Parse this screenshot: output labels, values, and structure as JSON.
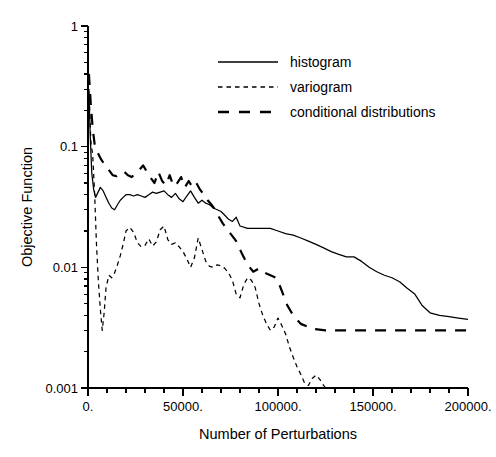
{
  "chart_data": {
    "type": "line",
    "title": "",
    "xlabel": "Number of Perturbations",
    "ylabel": "Objective Function",
    "xlim": [
      0,
      200000
    ],
    "ylim": [
      0.001,
      1
    ],
    "yscale": "log",
    "xscale": "linear",
    "grid": false,
    "legend_position": "top-center",
    "x_ticks": [
      0,
      50000,
      100000,
      150000,
      200000
    ],
    "x_tick_labels": [
      "0.",
      "50000.",
      "100000.",
      "150000.",
      "200000."
    ],
    "x_minor_tick_count_between": 4,
    "y_ticks": [
      1,
      0.1,
      0.01,
      0.001
    ],
    "y_tick_labels": [
      "1",
      "0.1",
      "0.01",
      "0.001"
    ],
    "series": [
      {
        "name": "histogram",
        "style": "solid",
        "x": [
          500,
          1200,
          2000,
          3000,
          4000,
          5000,
          6500,
          8000,
          9500,
          11000,
          12500,
          14000,
          15500,
          17000,
          18500,
          20000,
          22000,
          24000,
          26000,
          28000,
          30000,
          32000,
          34000,
          36000,
          38000,
          40000,
          42000,
          44000,
          46000,
          48000,
          50000,
          52000,
          54000,
          56000,
          58000,
          60000,
          62000,
          64000,
          66000,
          68000,
          70000,
          72000,
          74000,
          76000,
          78000,
          80000,
          84000,
          88000,
          92000,
          96000,
          100000,
          104000,
          108000,
          112000,
          116000,
          120000,
          124000,
          128000,
          132000,
          136000,
          140000,
          144000,
          148000,
          152000,
          156000,
          160000,
          164000,
          168000,
          172000,
          176000,
          180000,
          185000,
          190000,
          195000,
          200000
        ],
        "y": [
          0.28,
          0.12,
          0.06,
          0.044,
          0.038,
          0.041,
          0.046,
          0.043,
          0.038,
          0.034,
          0.031,
          0.03,
          0.033,
          0.036,
          0.038,
          0.04,
          0.04,
          0.039,
          0.04,
          0.039,
          0.038,
          0.04,
          0.042,
          0.041,
          0.042,
          0.043,
          0.04,
          0.038,
          0.041,
          0.037,
          0.035,
          0.039,
          0.043,
          0.038,
          0.034,
          0.036,
          0.034,
          0.033,
          0.031,
          0.03,
          0.029,
          0.027,
          0.025,
          0.024,
          0.026,
          0.022,
          0.021,
          0.021,
          0.021,
          0.021,
          0.02,
          0.019,
          0.0185,
          0.0175,
          0.0165,
          0.0155,
          0.0145,
          0.0135,
          0.0128,
          0.0122,
          0.0122,
          0.0112,
          0.01,
          0.0092,
          0.0086,
          0.0082,
          0.0076,
          0.0067,
          0.006,
          0.0048,
          0.0042,
          0.004,
          0.0039,
          0.0038,
          0.0037
        ],
        "start_value": 0.28,
        "end_value": 0.0037
      },
      {
        "name": "variogram",
        "style": "short-dash",
        "x": [
          500,
          1500,
          2500,
          3500,
          4500,
          5500,
          6500,
          7500,
          8500,
          9500,
          11000,
          12500,
          14000,
          15500,
          17000,
          18500,
          20000,
          22000,
          24000,
          26000,
          28000,
          30000,
          32000,
          34000,
          36000,
          38000,
          40000,
          42000,
          44000,
          46000,
          48000,
          50000,
          52000,
          54000,
          56000,
          58000,
          60000,
          62000,
          64000,
          66000,
          68000,
          70000,
          72000,
          74000,
          76000,
          78000,
          80000,
          82000,
          84000,
          86000,
          88000,
          90000,
          92000,
          94000,
          96000,
          98000,
          100000,
          102000,
          104000,
          106000,
          108000,
          110000,
          112000,
          114000,
          116000,
          118000,
          120000,
          122000,
          124000,
          125000
        ],
        "y": [
          0.3,
          0.11,
          0.085,
          0.04,
          0.015,
          0.0075,
          0.0045,
          0.003,
          0.0042,
          0.0068,
          0.0086,
          0.0082,
          0.009,
          0.0105,
          0.0125,
          0.0155,
          0.02,
          0.0215,
          0.0195,
          0.016,
          0.0148,
          0.0152,
          0.0172,
          0.015,
          0.0163,
          0.0205,
          0.022,
          0.017,
          0.0155,
          0.016,
          0.0148,
          0.0135,
          0.0118,
          0.01,
          0.012,
          0.0175,
          0.014,
          0.0112,
          0.0102,
          0.01,
          0.0105,
          0.0103,
          0.0098,
          0.009,
          0.0078,
          0.006,
          0.0056,
          0.0072,
          0.0082,
          0.0078,
          0.0068,
          0.005,
          0.004,
          0.0034,
          0.003,
          0.0032,
          0.0038,
          0.0033,
          0.0028,
          0.0022,
          0.0018,
          0.0015,
          0.0013,
          0.0011,
          0.00105,
          0.0012,
          0.00128,
          0.00118,
          0.00105,
          0.00098
        ],
        "start_value": 0.3,
        "end_value": 0.001
      },
      {
        "name": "conditional distributions",
        "style": "long-dash",
        "x": [
          500,
          1500,
          2500,
          3500,
          5000,
          7000,
          9000,
          11000,
          13000,
          15000,
          17000,
          19000,
          21000,
          23000,
          25000,
          27000,
          29000,
          31000,
          33000,
          35000,
          37000,
          39000,
          41000,
          43000,
          45000,
          47000,
          49000,
          51000,
          53000,
          55000,
          57000,
          59000,
          61000,
          63000,
          65000,
          67000,
          69000,
          71000,
          73000,
          75000,
          78000,
          81000,
          84000,
          87000,
          90000,
          93000,
          96000,
          99000,
          101000,
          103000,
          105000,
          108000,
          112000,
          118000,
          125000,
          135000,
          145000,
          155000,
          165000,
          175000,
          185000,
          195000,
          200000
        ],
        "y": [
          0.4,
          0.22,
          0.14,
          0.105,
          0.09,
          0.078,
          0.07,
          0.064,
          0.058,
          0.057,
          0.06,
          0.062,
          0.058,
          0.056,
          0.06,
          0.064,
          0.07,
          0.062,
          0.055,
          0.05,
          0.062,
          0.052,
          0.048,
          0.058,
          0.047,
          0.05,
          0.056,
          0.046,
          0.052,
          0.046,
          0.05,
          0.044,
          0.04,
          0.036,
          0.033,
          0.03,
          0.026,
          0.023,
          0.021,
          0.019,
          0.0165,
          0.013,
          0.0105,
          0.0092,
          0.0098,
          0.009,
          0.0086,
          0.0082,
          0.007,
          0.0058,
          0.0048,
          0.004,
          0.0034,
          0.0031,
          0.003,
          0.003,
          0.003,
          0.003,
          0.003,
          0.003,
          0.003,
          0.003,
          0.003
        ],
        "start_value": 0.4,
        "end_value": 0.003
      }
    ],
    "legend": [
      {
        "label": "histogram",
        "style": "solid"
      },
      {
        "label": "variogram",
        "style": "short-dash"
      },
      {
        "label": "conditional distributions",
        "style": "long-dash"
      }
    ],
    "colors": {
      "line": "#000000",
      "background": "#ffffff",
      "axis": "#000000"
    }
  }
}
